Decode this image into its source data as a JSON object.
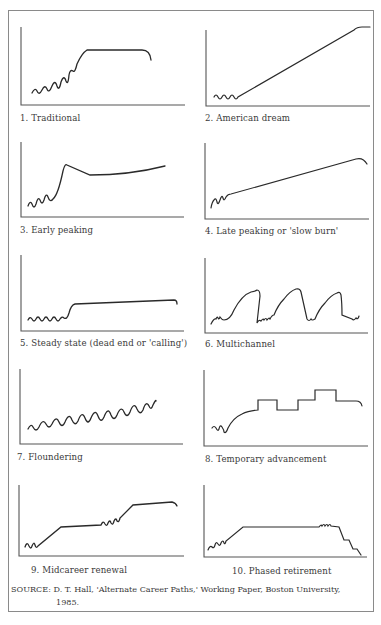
{
  "figure": {
    "panels": [
      {
        "id": 1,
        "label": "1. Traditional"
      },
      {
        "id": 2,
        "label": "2. American dream"
      },
      {
        "id": 3,
        "label": "3. Early peaking"
      },
      {
        "id": 4,
        "label": "4. Late peaking or 'slow burn'"
      },
      {
        "id": 5,
        "label": "5. Steady state (dead end or 'calling')"
      },
      {
        "id": 6,
        "label": "6. Multichannel"
      },
      {
        "id": 7,
        "label": "7. Floundering"
      },
      {
        "id": 8,
        "label": "8. Temporary advancement"
      },
      {
        "id": 9,
        "label": "9. Midcareer renewal"
      },
      {
        "id": 10,
        "label": "10. Phased retirement"
      }
    ],
    "source_line1": "SOURCE: D. T. Hall, 'Alternate Career Paths,' Working Paper, Boston University,",
    "source_line2": "1985.",
    "colors": {
      "line": "#2a2a2a",
      "axis": "#555555",
      "frame": "#8a8a8a"
    }
  }
}
